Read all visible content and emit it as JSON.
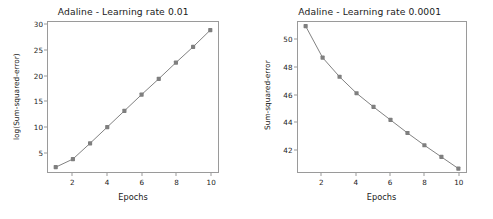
{
  "figure": {
    "background_color": "#ffffff",
    "line_color": "#7f7f7f",
    "marker_color": "#7f7f7f",
    "axis_color": "#9a9a9a",
    "text_color": "#1a1a1a"
  },
  "chart_data": [
    {
      "type": "line",
      "title": "Adaline - Learning rate 0.01",
      "xlabel": "Epochs",
      "ylabel": "log(Sum-squared-error)",
      "x": [
        1,
        2,
        3,
        4,
        5,
        6,
        7,
        8,
        9,
        10
      ],
      "values": [
        2.0,
        3.6,
        6.7,
        9.9,
        13.1,
        16.3,
        19.4,
        22.6,
        25.7,
        29.0
      ],
      "xticks": [
        2,
        4,
        6,
        8,
        10
      ],
      "yticks": [
        5,
        10,
        15,
        20,
        25,
        30
      ],
      "xlim": [
        0.55,
        10.45
      ],
      "ylim": [
        1.05,
        30.6
      ],
      "grid": false,
      "legend": "none",
      "marker": "square",
      "series_name": "log(Sum-squared-error)"
    },
    {
      "type": "line",
      "title": "Adaline - Learning rate 0.0001",
      "xlabel": "Epochs",
      "ylabel": "Sum-squared-error",
      "x": [
        1,
        2,
        3,
        4,
        5,
        6,
        7,
        8,
        9,
        10
      ],
      "values": [
        51.0,
        48.7,
        47.3,
        46.1,
        45.1,
        44.15,
        43.2,
        42.3,
        41.45,
        40.6
      ],
      "xticks": [
        2,
        4,
        6,
        8,
        10
      ],
      "yticks": [
        42,
        44,
        46,
        48,
        50
      ],
      "xlim": [
        0.55,
        10.45
      ],
      "ylim": [
        40.35,
        51.3
      ],
      "grid": false,
      "legend": "none",
      "marker": "square",
      "series_name": "Sum-squared-error"
    }
  ]
}
